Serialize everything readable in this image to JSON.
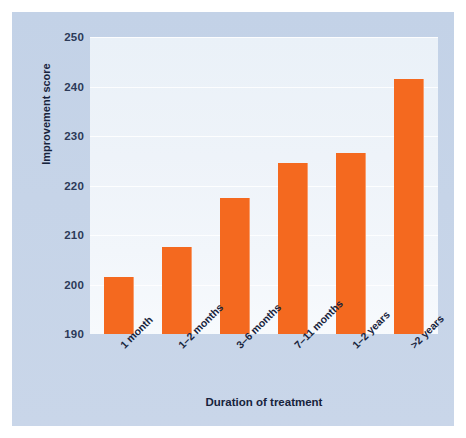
{
  "figure": {
    "panel_color": "#c6d4e8",
    "plot_background": "#eef3f9",
    "bar_color": "#f4691f",
    "text_color": "#17233c"
  },
  "chart_data": {
    "type": "bar",
    "title": "",
    "xlabel": "Duration of treatment",
    "ylabel": "Improvement score",
    "categories": [
      "1 month",
      "1–2 months",
      "3–6 months",
      "7–11 months",
      "1–2 years",
      ">2 years"
    ],
    "values": [
      201.5,
      207.5,
      217.5,
      224.5,
      226.5,
      241.5
    ],
    "ylim": [
      190,
      250
    ],
    "yticks": [
      190,
      200,
      210,
      220,
      230,
      240,
      250
    ],
    "ytick_labels": [
      "190",
      "200",
      "210",
      "220",
      "230",
      "240",
      "250"
    ],
    "grid": true,
    "grid_axis": "y",
    "legend": null,
    "series": [
      {
        "name": "Improvement score",
        "values": [
          201.5,
          207.5,
          217.5,
          224.5,
          226.5,
          241.5
        ]
      }
    ]
  }
}
